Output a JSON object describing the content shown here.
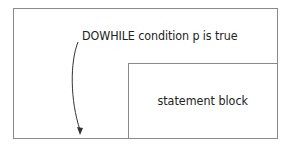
{
  "diagram": {
    "condition_text": "DOWHILE condition p is true",
    "statement_block_label": "statement block",
    "line_color": "#8a8a8a",
    "text_color": "#222222"
  }
}
